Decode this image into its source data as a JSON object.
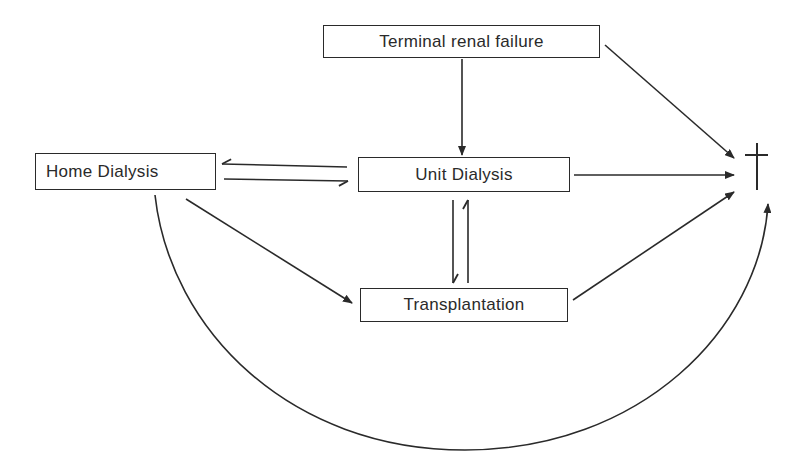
{
  "diagram": {
    "type": "flow",
    "nodes": [
      {
        "id": "terminal",
        "label": "Terminal renal failure",
        "x": 323,
        "y": 25,
        "w": 277,
        "h": 33
      },
      {
        "id": "home",
        "label": "Home Dialysis",
        "x": 35,
        "y": 153,
        "w": 181,
        "h": 37
      },
      {
        "id": "unit",
        "label": "Unit Dialysis",
        "x": 358,
        "y": 157,
        "w": 212,
        "h": 35
      },
      {
        "id": "transplant",
        "label": "Transplantation",
        "x": 360,
        "y": 288,
        "w": 208,
        "h": 34
      },
      {
        "id": "death",
        "label": "",
        "symbol": "dagger-icon"
      }
    ],
    "edges": [
      {
        "from": "terminal",
        "to": "unit"
      },
      {
        "from": "terminal",
        "to": "death"
      },
      {
        "from": "unit",
        "to": "home"
      },
      {
        "from": "home",
        "to": "unit"
      },
      {
        "from": "unit",
        "to": "death"
      },
      {
        "from": "unit",
        "to": "transplant"
      },
      {
        "from": "transplant",
        "to": "unit"
      },
      {
        "from": "home",
        "to": "transplant"
      },
      {
        "from": "transplant",
        "to": "death"
      },
      {
        "from": "home",
        "to": "death",
        "style": "curved"
      }
    ],
    "line_color": "#2a2a2a"
  }
}
